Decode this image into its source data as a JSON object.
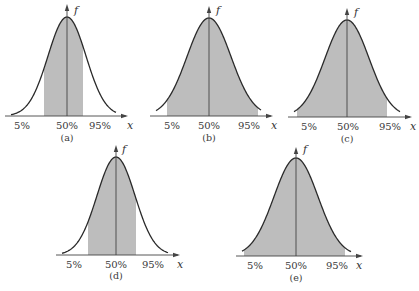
{
  "figure": {
    "fill_color": "#bdbdbd",
    "line_color": "#2a2a2a",
    "axis_color": "#444444",
    "y_axis_label": "f",
    "x_axis_label": "x"
  },
  "panels": [
    {
      "id": "a",
      "caption": "(a)",
      "labels": [
        "5%",
        "50%",
        "95%"
      ],
      "shaded": "central 5%-95%",
      "geom": {
        "cx": 67,
        "axisY": 116,
        "peakY": 17,
        "arrowTop": 4,
        "sigma": 19,
        "left": 5,
        "right": 128,
        "shadeL": 44,
        "shadeR": 83,
        "labelX": [
          22,
          67,
          100
        ],
        "labelY": 129,
        "captionY": 141,
        "xLabelX": 127,
        "fLabelX": 74,
        "fLabelY": 14
      }
    },
    {
      "id": "b",
      "caption": "(b)",
      "labels": [
        "5%",
        "50%",
        "95%"
      ],
      "shaded": "above 5%",
      "geom": {
        "cx": 209,
        "axisY": 116,
        "peakY": 18,
        "arrowTop": 6,
        "sigma": 22,
        "left": 150,
        "right": 273,
        "shadeL": 167,
        "shadeR": 258,
        "labelX": [
          172,
          209,
          249
        ],
        "labelY": 129,
        "captionY": 141,
        "xLabelX": 271,
        "fLabelX": 216,
        "fLabelY": 14
      }
    },
    {
      "id": "c",
      "caption": "(c)",
      "labels": [
        "5%",
        "50%",
        "95%"
      ],
      "shaded": "below 95%",
      "geom": {
        "cx": 347,
        "axisY": 117,
        "peakY": 20,
        "arrowTop": 8,
        "sigma": 22,
        "left": 288,
        "right": 412,
        "shadeL": 297,
        "shadeR": 387,
        "labelX": [
          309,
          348,
          390
        ],
        "labelY": 130,
        "captionY": 142,
        "xLabelX": 410,
        "fLabelX": 354,
        "fLabelY": 16
      }
    },
    {
      "id": "d",
      "caption": "(d)",
      "labels": [
        "5%",
        "50%",
        "95%"
      ],
      "shaded": "central",
      "geom": {
        "cx": 116,
        "axisY": 255,
        "peakY": 157,
        "arrowTop": 145,
        "sigma": 19,
        "left": 56,
        "right": 180,
        "shadeL": 88,
        "shadeR": 136,
        "labelX": [
          74,
          116,
          153
        ],
        "labelY": 268,
        "captionY": 279,
        "xLabelX": 177,
        "fLabelX": 122,
        "fLabelY": 153
      }
    },
    {
      "id": "e",
      "caption": "(e)",
      "labels": [
        "5%",
        "50%",
        "95%"
      ],
      "shaded": "total",
      "geom": {
        "cx": 296,
        "axisY": 256,
        "peakY": 158,
        "arrowTop": 147,
        "sigma": 22,
        "left": 236,
        "right": 363,
        "shadeL": 244,
        "shadeR": 345,
        "labelX": [
          255,
          296,
          337
        ],
        "labelY": 269,
        "captionY": 281,
        "xLabelX": 356,
        "fLabelX": 303,
        "fLabelY": 153
      }
    }
  ]
}
